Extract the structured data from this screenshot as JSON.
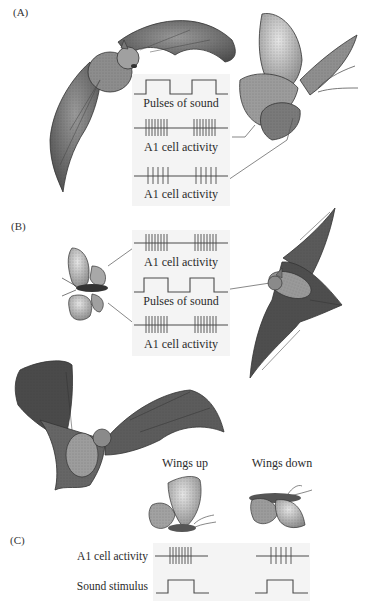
{
  "figure": {
    "panels": [
      {
        "label": "(A)",
        "traces": [
          {
            "type": "sound",
            "caption": "Pulses of sound",
            "pulses": 2
          },
          {
            "type": "spikes",
            "caption": "A1 cell activity",
            "spikes_per_burst": 8,
            "bursts": 2
          },
          {
            "type": "spikes",
            "caption": "A1 cell activity",
            "spikes_per_burst": 5,
            "bursts": 2
          }
        ]
      },
      {
        "label": "(B)",
        "traces": [
          {
            "type": "spikes",
            "caption": "A1 cell activity",
            "spikes_per_burst": 8,
            "bursts": 2
          },
          {
            "type": "sound",
            "caption": "Pulses of sound",
            "pulses": 2
          },
          {
            "type": "spikes",
            "caption": "A1 cell activity",
            "spikes_per_burst": 8,
            "bursts": 2
          }
        ]
      },
      {
        "label": "(C)",
        "columns": [
          {
            "header": "Wings up",
            "spikes_per_burst": 8
          },
          {
            "header": "Wings down",
            "spikes_per_burst": 5
          }
        ],
        "row_labels": {
          "activity": "A1 cell activity",
          "stimulus": "Sound stimulus"
        }
      }
    ],
    "colors": {
      "trace": "#4a4a4a",
      "bat": "#6e6e6e",
      "moth": "#9a9a9a",
      "box": "#f4f4f4"
    }
  }
}
